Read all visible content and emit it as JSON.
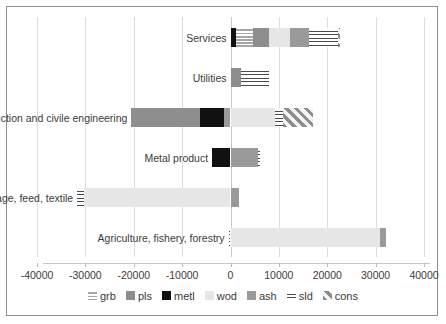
{
  "chart_data": {
    "type": "bar",
    "orientation": "horizontal",
    "stacked": true,
    "title": "",
    "xlabel": "",
    "ylabel": "",
    "xlim": [
      -40000,
      40000
    ],
    "xticks": [
      -40000,
      -30000,
      -20000,
      -10000,
      0,
      10000,
      20000,
      30000,
      40000
    ],
    "xtick_labels": [
      "-40000",
      "-30000",
      "-20000",
      "-10000",
      "0",
      "10000",
      "20000",
      "30000",
      "40000"
    ],
    "grid": true,
    "legend_position": "bottom",
    "legend": [
      "grb",
      "pls",
      "metl",
      "wod",
      "ash",
      "sld",
      "cons"
    ],
    "categories": [
      "Services",
      "Utilities",
      "Construction and civile engineering",
      "Metal product",
      "Food, beverage, feed, textile",
      "Agriculture, fishery, forestry"
    ],
    "series": [
      {
        "name": "grb",
        "color": "#b0b0b0",
        "values": [
          3500,
          0,
          0,
          0,
          0,
          0
        ]
      },
      {
        "name": "pls",
        "color": "#8e8e8e",
        "values": [
          3000,
          2200,
          -20500,
          0,
          0,
          0
        ]
      },
      {
        "name": "metl",
        "color": "#111111",
        "values": [
          1200,
          0,
          -6000,
          -4000,
          0,
          0
        ]
      },
      {
        "name": "wod",
        "color": "#e6e6e6",
        "values": [
          4800,
          0,
          9200,
          0,
          -30500,
          31000
        ]
      },
      {
        "name": "ash",
        "color": "#9a9a9a",
        "values": [
          4000,
          0,
          1400,
          5600,
          1600,
          1200
        ]
      },
      {
        "name": "sld",
        "color": "#f2f2f2",
        "values": [
          6800,
          5800,
          1500,
          0,
          -1800,
          0
        ]
      },
      {
        "name": "cons",
        "color": "#f0f0f0",
        "values": [
          400,
          0,
          14000,
          0,
          0,
          0
        ]
      }
    ],
    "bar_segments": [
      {
        "category": "Services",
        "segments": [
          {
            "key": "metl",
            "start": 0,
            "end": 1200
          },
          {
            "key": "grb",
            "start": 1200,
            "end": 4700
          },
          {
            "key": "pls",
            "start": 4700,
            "end": 7900
          },
          {
            "key": "wod",
            "start": 7900,
            "end": 12400
          },
          {
            "key": "ash",
            "start": 12400,
            "end": 16200
          },
          {
            "key": "sld",
            "start": 16200,
            "end": 22200
          },
          {
            "key": "cons",
            "start": 22200,
            "end": 22700
          }
        ]
      },
      {
        "category": "Utilities",
        "segments": [
          {
            "key": "pls",
            "start": 0,
            "end": 2100
          },
          {
            "key": "sld",
            "start": 2100,
            "end": 8000
          }
        ]
      },
      {
        "category": "Construction and civile engineering",
        "segments": [
          {
            "key": "pls",
            "start": -20500,
            "end": -6300
          },
          {
            "key": "metl",
            "start": -6300,
            "end": -1400
          },
          {
            "key": "ash",
            "start": -1400,
            "end": 0
          },
          {
            "key": "wod",
            "start": 0,
            "end": 9300
          },
          {
            "key": "sld",
            "start": 9300,
            "end": 10800
          },
          {
            "key": "cons",
            "start": 10800,
            "end": 17100
          }
        ]
      },
      {
        "category": "Metal product",
        "segments": [
          {
            "key": "metl",
            "start": -3800,
            "end": 0
          },
          {
            "key": "ash",
            "start": 0,
            "end": 5700
          },
          {
            "key": "sld",
            "start": 5700,
            "end": 6200
          }
        ]
      },
      {
        "category": "Food, beverage, feed, textile",
        "segments": [
          {
            "key": "sld",
            "start": -31700,
            "end": -30200
          },
          {
            "key": "wod",
            "start": -30200,
            "end": 0
          },
          {
            "key": "ash",
            "start": 0,
            "end": 1700
          }
        ]
      },
      {
        "category": "Agriculture, fishery, forestry",
        "segments": [
          {
            "key": "sld",
            "start": -400,
            "end": 0
          },
          {
            "key": "wod",
            "start": 0,
            "end": 31000
          },
          {
            "key": "ash",
            "start": 31000,
            "end": 32200
          }
        ]
      }
    ]
  }
}
